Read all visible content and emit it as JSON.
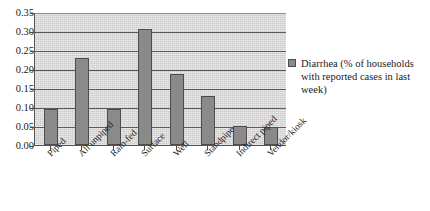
{
  "chart_data": {
    "type": "bar",
    "title": "",
    "xlabel": "",
    "ylabel": "",
    "ylim": [
      0.0,
      0.35
    ],
    "ytick_labels": [
      "0.00",
      "0.05",
      "0.10",
      "0.15",
      "0.20",
      "0.25",
      "0.30",
      "0.35"
    ],
    "ytick_values": [
      0.0,
      0.05,
      0.1,
      0.15,
      0.2,
      0.25,
      0.3,
      0.35
    ],
    "grid": true,
    "legend_position": "right",
    "categories": [
      "Piped",
      "All unpiped",
      "Rain-fed",
      "Surface",
      "Well",
      "Standpipe",
      "Indirect piped",
      "Vendor/kiosk"
    ],
    "series": [
      {
        "name": "Diarrhea (% of households with reported cases in last week)",
        "color": "#8a8a8a",
        "values": [
          0.095,
          0.23,
          0.095,
          0.305,
          0.188,
          0.13,
          0.05,
          0.048
        ]
      }
    ]
  },
  "legend": {
    "entries": [
      {
        "label": "Diarrhea (% of households with reported cases in last week)",
        "color": "#8a8a8a"
      }
    ]
  },
  "colors": {
    "bar_fill": "#8a8a8a",
    "bar_stroke": "#4d4d4d",
    "plot_background": "#d4d4d4",
    "gridline": "#5a5a5a",
    "axis": "#555555",
    "text": "#1a1a1a"
  }
}
